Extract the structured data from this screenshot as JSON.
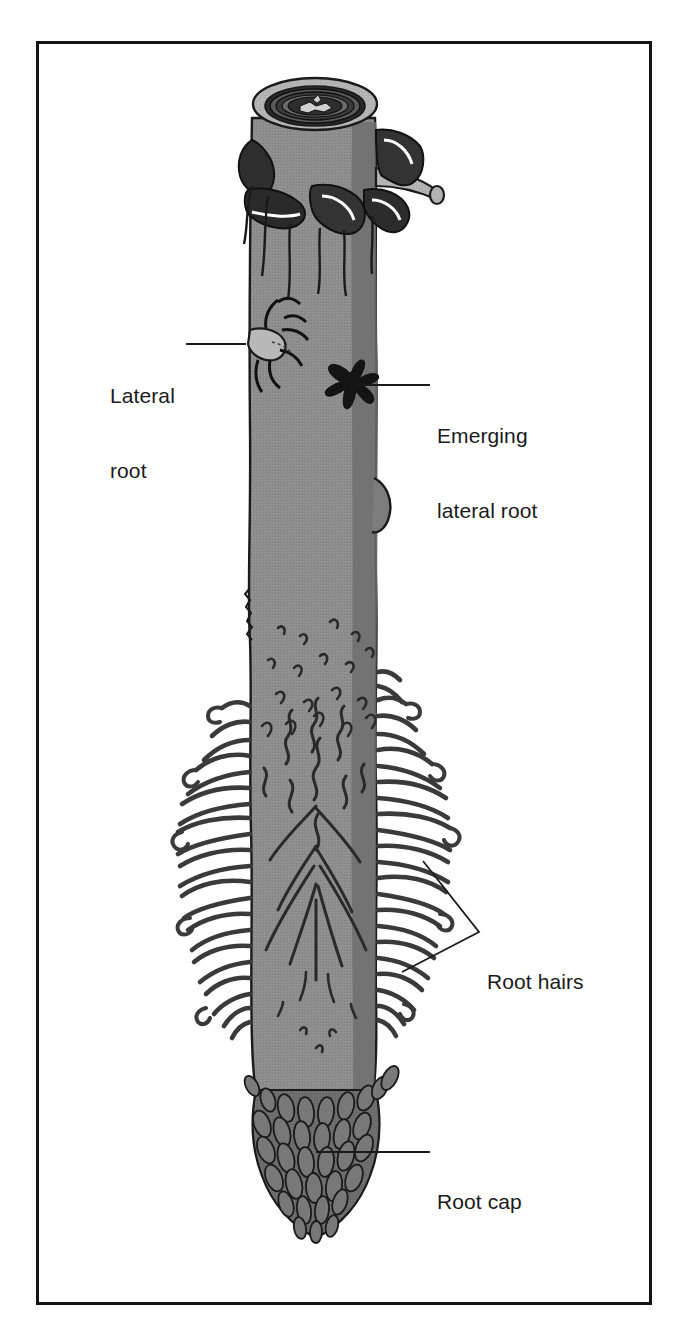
{
  "figure": {
    "frame": {
      "border_color": "#141414",
      "background": "#ffffff"
    }
  },
  "colors": {
    "outline": "#1a1a1a",
    "root_body": "#8d8d8d",
    "root_body_light": "#b3b3b3",
    "root_body_shadow": "#6f6f6f",
    "root_cap_cell": "#6d6d6d",
    "root_cap_cell_dark": "#555555",
    "bark_dark": "#2e2e2e",
    "highlight": "#ffffff",
    "label_text": "#1a1a1a",
    "leader_line": "#1a1a1a"
  },
  "labels": [
    {
      "id": "lateral-root",
      "line1": "Lateral",
      "line2": "root",
      "text": "Lateral root",
      "leader": {
        "from_x": 186,
        "from_y": 344,
        "to_x": 246,
        "to_y": 344
      }
    },
    {
      "id": "emerging-lateral-root",
      "line1": "Emerging",
      "line2": "lateral root",
      "text": "Emerging lateral root",
      "leader": {
        "from_x": 355,
        "from_y": 385,
        "to_x": 430,
        "to_y": 385
      }
    },
    {
      "id": "root-hairs",
      "line1": "Root hairs",
      "line2": "",
      "text": "Root hairs",
      "leader": {
        "vertex_x": 479,
        "vertex_y": 932,
        "branch1_x": 423,
        "branch1_y": 861,
        "branch2_x": 402,
        "branch2_y": 972
      }
    },
    {
      "id": "root-cap",
      "line1": "Root cap",
      "line2": "",
      "text": "Root cap",
      "leader": {
        "from_x": 316,
        "from_y": 1152,
        "to_x": 430,
        "to_y": 1152
      }
    }
  ],
  "anatomy": {
    "cut_cross_section": {
      "name": "cut end of root with vascular cylinder",
      "center_x": 315,
      "center_y": 104,
      "rings": 5
    },
    "shaft": {
      "left_x": 250,
      "right_x": 378,
      "top_y": 120,
      "bottom_y": 1100
    },
    "root_hair_zone": {
      "top_y": 600,
      "bottom_y": 1040,
      "left_x": 178,
      "right_x": 448
    },
    "root_cap": {
      "top_y": 1085,
      "tip_y": 1235,
      "left_x": 255,
      "right_x": 385
    },
    "bump": {
      "x": 376,
      "y": 505
    }
  }
}
